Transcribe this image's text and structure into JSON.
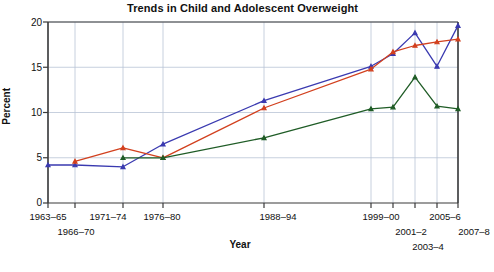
{
  "chart_data": {
    "type": "line",
    "title": "Trends in Child and Adolescent Overweight",
    "xlabel": "Year",
    "ylabel": "Percent",
    "ylim": [
      0,
      20
    ],
    "yticks": [
      0,
      5,
      10,
      15,
      20
    ],
    "grid": true,
    "legend_position": "inline-annotations",
    "categories": [
      "1963–65",
      "1966–70",
      "1971–74",
      "1976–80",
      "1988–94",
      "1999–00",
      "2001–2",
      "2003–4",
      "2005–6",
      "2007–8"
    ],
    "series": [
      {
        "name": "6–11 years",
        "color": "#3a3ab0",
        "values": [
          4.2,
          4.2,
          4.0,
          6.5,
          11.3,
          15.1,
          16.5,
          18.8,
          15.1,
          19.6
        ]
      },
      {
        "name": "12–19 years",
        "color": "#d2401e",
        "values": [
          null,
          4.6,
          6.1,
          5.0,
          10.5,
          14.8,
          16.7,
          17.4,
          17.8,
          18.1
        ]
      },
      {
        "name": "2–5 years",
        "color": "#1f5c26",
        "values": [
          null,
          null,
          5.0,
          5.0,
          7.2,
          10.4,
          10.6,
          13.9,
          10.7,
          10.4
        ]
      }
    ]
  },
  "annotations": [
    {
      "label": "6–11 years",
      "color": "#3a3ab0"
    },
    {
      "label": "12–19 years",
      "color": "#d2401e"
    },
    {
      "label": "2–5 years",
      "color": "#1f5c26"
    }
  ],
  "axis": {
    "ytick_labels": [
      "20",
      "15",
      "10",
      "5",
      "0"
    ],
    "xtick_row1": [
      "1963–65",
      "1971–74",
      "1976–80",
      "1988–94",
      "1999–00",
      "2005–6"
    ],
    "xtick_row2": [
      "1966–70",
      "2001–2",
      "2007–8"
    ],
    "xtick_row3": [
      "2003–4"
    ]
  }
}
